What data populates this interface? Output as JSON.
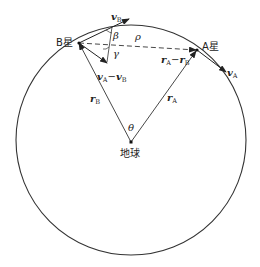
{
  "diagram": {
    "labels": {
      "star_b": "B星",
      "star_a": "A星",
      "earth": "地球",
      "v_b": "v",
      "v_b_sub": "B",
      "v_a": "v",
      "v_a_sub": "A",
      "rel_v_a": "v",
      "rel_v_a_sub": "A",
      "rel_v_minus": "−",
      "rel_v_b": "v",
      "rel_v_b_sub": "B",
      "r_b": "r",
      "r_b_sub": "B",
      "r_a": "r",
      "r_a_sub": "A",
      "rel_r_a": "r",
      "rel_r_a_sub": "A",
      "rel_r_minus": "−",
      "rel_r_b": "r",
      "rel_r_b_sub": "B",
      "beta": "β",
      "gamma": "γ",
      "rho": "ρ",
      "theta": "θ"
    },
    "colors": {
      "stroke": "#333333",
      "text": "#222222"
    }
  }
}
